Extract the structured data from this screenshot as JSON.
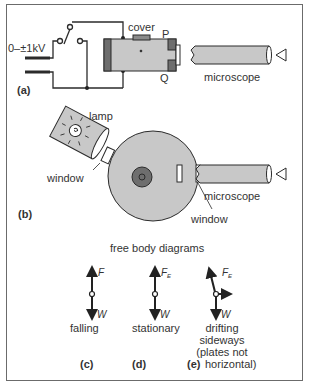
{
  "diagram": {
    "panel_a": {
      "label": "(a)",
      "voltage": "0–±1kV",
      "cover": "cover",
      "plate_top": "P",
      "plate_bottom": "Q",
      "microscope": "microscope"
    },
    "panel_b": {
      "label": "(b)",
      "lamp": "lamp",
      "window_left": "window",
      "window_right": "window",
      "microscope": "microscope"
    },
    "free_body": {
      "heading": "free body diagrams",
      "c": {
        "label": "(c)",
        "caption": "falling",
        "up_force": "F",
        "down_force": "W"
      },
      "d": {
        "label": "(d)",
        "caption": "stationary",
        "up_force": "F",
        "up_sub": "E",
        "down_force": "W"
      },
      "e": {
        "label": "(e)",
        "caption_1": "drifting",
        "caption_2": "sideways",
        "caption_3": "(plates not",
        "caption_4": "horizontal)",
        "up_force": "F",
        "up_sub": "E",
        "down_force": "W"
      }
    },
    "colors": {
      "fill_gray": "#c8c8c8",
      "dark_gray": "#6e6e6e",
      "stroke": "#2b2b2b",
      "border": "#6b6b6b"
    }
  }
}
